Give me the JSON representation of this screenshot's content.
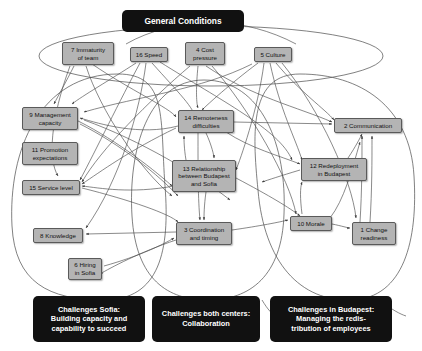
{
  "diagram": {
    "title": "General Conditions",
    "type": "causal-loop-influence-diagram"
  },
  "groups": [
    {
      "id": "general-conditions",
      "label": "General Conditions",
      "shape": "ellipse"
    },
    {
      "id": "sofia",
      "label": "Challenges Sofia:\nBuilding capacity and\ncapability to succeed",
      "shape": "ellipse"
    },
    {
      "id": "both-centers",
      "label": "Challenges both centers:\nCollaboration",
      "shape": "ellipse"
    },
    {
      "id": "budapest",
      "label": "Challenges in Budapest:\nManaging the redis-\ntribution of employees",
      "shape": "ellipse"
    }
  ],
  "nodes": [
    {
      "id": "n7",
      "label": "7 Immaturity\nof team",
      "x": 62,
      "y": 42,
      "w": 52,
      "h": 23,
      "group": "general-conditions"
    },
    {
      "id": "n16",
      "label": "16 Speed",
      "x": 130,
      "y": 47,
      "w": 38,
      "h": 15,
      "group": "general-conditions"
    },
    {
      "id": "n4",
      "label": "4 Cost\npressure",
      "x": 185,
      "y": 42,
      "w": 40,
      "h": 23,
      "group": "general-conditions"
    },
    {
      "id": "n5",
      "label": "5 Culture",
      "x": 254,
      "y": 47,
      "w": 38,
      "h": 15,
      "group": "general-conditions"
    },
    {
      "id": "n9",
      "label": "9 Management\ncapacity",
      "x": 22,
      "y": 107,
      "w": 56,
      "h": 23,
      "group": "sofia"
    },
    {
      "id": "n11",
      "label": "11 Promotion\nexpectations",
      "x": 22,
      "y": 142,
      "w": 56,
      "h": 23,
      "group": "sofia"
    },
    {
      "id": "n15",
      "label": "15 Service level",
      "x": 22,
      "y": 180,
      "w": 58,
      "h": 15,
      "group": "sofia"
    },
    {
      "id": "n8",
      "label": "8 Knowledge",
      "x": 33,
      "y": 228,
      "w": 50,
      "h": 15,
      "group": "sofia"
    },
    {
      "id": "n6",
      "label": "6 Hiring\nin Sofia",
      "x": 68,
      "y": 258,
      "w": 34,
      "h": 22,
      "group": "sofia"
    },
    {
      "id": "n14",
      "label": "14 Remoteness\ndifficulties",
      "x": 178,
      "y": 110,
      "w": 56,
      "h": 23,
      "group": "both-centers"
    },
    {
      "id": "n13",
      "label": "13 Relationship\nbetween Budapest\nand Sofia",
      "x": 172,
      "y": 160,
      "w": 64,
      "h": 32,
      "group": "both-centers"
    },
    {
      "id": "n3",
      "label": "3 Coordination\nand timing",
      "x": 176,
      "y": 222,
      "w": 56,
      "h": 23,
      "group": "both-centers"
    },
    {
      "id": "n2",
      "label": "2 Communication",
      "x": 334,
      "y": 118,
      "w": 68,
      "h": 15,
      "group": "budapest"
    },
    {
      "id": "n12",
      "label": "12 Redeployment\nin Budapest",
      "x": 301,
      "y": 158,
      "w": 66,
      "h": 23,
      "group": "budapest"
    },
    {
      "id": "n10",
      "label": "10 Morale",
      "x": 290,
      "y": 216,
      "w": 42,
      "h": 15,
      "group": "budapest"
    },
    {
      "id": "n1",
      "label": "1 Change\nreadiness",
      "x": 352,
      "y": 222,
      "w": 44,
      "h": 23,
      "group": "budapest"
    }
  ],
  "colors": {
    "node_fill": "#b4b4b4",
    "node_border": "#5a5a5a",
    "box_fill": "#111111",
    "box_text": "#ffffff",
    "edge": "#4a4a4a",
    "background": "#ffffff"
  }
}
